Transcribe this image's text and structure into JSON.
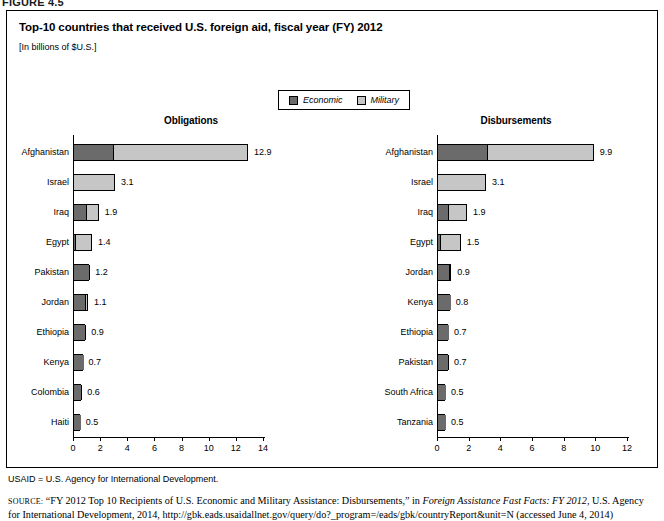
{
  "figure": {
    "label": "FIGURE 4.5"
  },
  "panel": {
    "title": "Top-10 countries that received U.S. foreign aid, fiscal year (FY) 2012",
    "subtitle": "[In billions of $U.S.]"
  },
  "legend": {
    "items": [
      {
        "label": "Economic",
        "color": "#6b6b6b",
        "icon": "legend-swatch-economic"
      },
      {
        "label": "Military",
        "color": "#c6c6c6",
        "icon": "legend-swatch-military"
      }
    ]
  },
  "notes": {
    "usaid": "USAID = U.S. Agency for International Development.",
    "source_keyword": "SOURCE:",
    "source_part1": " “FY 2012 Top 10 Recipients of U.S. Economic and Military Assistance: Disbursements,” in ",
    "source_italic": "Foreign Assistance Fast Facts: FY 2012",
    "source_part2": ", U.S. Agency for International Development, 2014, http://gbk.eads.usaidallnet.gov/query/do?_program=/eads/gbk/countryReport&unit=N (accessed June 4, 2014)"
  },
  "chart_data": [
    {
      "id": "obligations",
      "type": "bar",
      "orientation": "horizontal",
      "stacked": true,
      "title": "Obligations",
      "xlabel": "",
      "ylabel": "",
      "xlim": [
        0,
        14
      ],
      "xticks": [
        0,
        2,
        4,
        6,
        8,
        10,
        12,
        14
      ],
      "grid": false,
      "legend_position": "top-center",
      "series": [
        {
          "name": "Economic",
          "color": "#6b6b6b"
        },
        {
          "name": "Military",
          "color": "#c6c6c6"
        }
      ],
      "categories": [
        "Afghanistan",
        "Israel",
        "Iraq",
        "Egypt",
        "Pakistan",
        "Jordan",
        "Ethiopia",
        "Kenya",
        "Colombia",
        "Haiti"
      ],
      "rows": [
        {
          "category": "Afghanistan",
          "economic": 2.9,
          "military": 10.0,
          "total": 12.9,
          "label": "12.9"
        },
        {
          "category": "Israel",
          "economic": 0.0,
          "military": 3.1,
          "total": 3.1,
          "label": "3.1"
        },
        {
          "category": "Iraq",
          "economic": 0.9,
          "military": 1.0,
          "total": 1.9,
          "label": "1.9"
        },
        {
          "category": "Egypt",
          "economic": 0.1,
          "military": 1.3,
          "total": 1.4,
          "label": "1.4"
        },
        {
          "category": "Pakistan",
          "economic": 1.1,
          "military": 0.1,
          "total": 1.2,
          "label": "1.2"
        },
        {
          "category": "Jordan",
          "economic": 0.8,
          "military": 0.3,
          "total": 1.1,
          "label": "1.1"
        },
        {
          "category": "Ethiopia",
          "economic": 0.8,
          "military": 0.1,
          "total": 0.9,
          "label": "0.9"
        },
        {
          "category": "Kenya",
          "economic": 0.7,
          "military": 0.0,
          "total": 0.7,
          "label": "0.7"
        },
        {
          "category": "Colombia",
          "economic": 0.5,
          "military": 0.1,
          "total": 0.6,
          "label": "0.6"
        },
        {
          "category": "Haiti",
          "economic": 0.5,
          "military": 0.0,
          "total": 0.5,
          "label": "0.5"
        }
      ]
    },
    {
      "id": "disbursements",
      "type": "bar",
      "orientation": "horizontal",
      "stacked": true,
      "title": "Disbursements",
      "xlabel": "",
      "ylabel": "",
      "xlim": [
        0,
        12
      ],
      "xticks": [
        0,
        2,
        4,
        6,
        8,
        10,
        12
      ],
      "grid": false,
      "legend_position": "top-center",
      "series": [
        {
          "name": "Economic",
          "color": "#6b6b6b"
        },
        {
          "name": "Military",
          "color": "#c6c6c6"
        }
      ],
      "categories": [
        "Afghanistan",
        "Israel",
        "Iraq",
        "Egypt",
        "Jordan",
        "Kenya",
        "Ethiopia",
        "Pakistan",
        "South Africa",
        "Tanzania"
      ],
      "rows": [
        {
          "category": "Afghanistan",
          "economic": 3.1,
          "military": 6.8,
          "total": 9.9,
          "label": "9.9"
        },
        {
          "category": "Israel",
          "economic": 0.0,
          "military": 3.1,
          "total": 3.1,
          "label": "3.1"
        },
        {
          "category": "Iraq",
          "economic": 0.6,
          "military": 1.3,
          "total": 1.9,
          "label": "1.9"
        },
        {
          "category": "Egypt",
          "economic": 0.1,
          "military": 1.4,
          "total": 1.5,
          "label": "1.5"
        },
        {
          "category": "Jordan",
          "economic": 0.7,
          "military": 0.2,
          "total": 0.9,
          "label": "0.9"
        },
        {
          "category": "Kenya",
          "economic": 0.8,
          "military": 0.0,
          "total": 0.8,
          "label": "0.8"
        },
        {
          "category": "Ethiopia",
          "economic": 0.7,
          "military": 0.0,
          "total": 0.7,
          "label": "0.7"
        },
        {
          "category": "Pakistan",
          "economic": 0.6,
          "military": 0.1,
          "total": 0.7,
          "label": "0.7"
        },
        {
          "category": "South Africa",
          "economic": 0.5,
          "military": 0.0,
          "total": 0.5,
          "label": "0.5"
        },
        {
          "category": "Tanzania",
          "economic": 0.5,
          "military": 0.0,
          "total": 0.5,
          "label": "0.5"
        }
      ]
    }
  ]
}
